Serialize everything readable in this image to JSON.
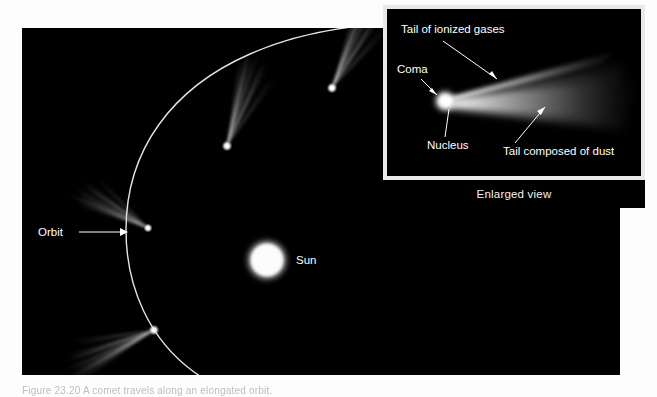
{
  "figure": {
    "background_color": "#ffffff",
    "panel_color": "#000000",
    "label_color": "#ffffff",
    "inset_border_color": "#e9e9e9"
  },
  "main_panel": {
    "name": "comet-orbit-panel",
    "labels": {
      "orbit": "Orbit",
      "sun": "Sun"
    },
    "sun": {
      "cx": 245,
      "cy": 232,
      "radius": 19,
      "color": "#ffffff"
    },
    "comets": [
      {
        "id": "comet-upper-right",
        "x": 310,
        "y": 60,
        "tail_angle": -62
      },
      {
        "id": "comet-upper-left",
        "x": 205,
        "y": 118,
        "tail_angle": -70
      },
      {
        "id": "comet-perihelion",
        "x": 126,
        "y": 200,
        "tail_angle": -118
      },
      {
        "id": "comet-lower-left",
        "x": 132,
        "y": 302,
        "tail_angle": 157
      },
      {
        "id": "comet-lower",
        "x": 196,
        "y": 357,
        "tail_angle": 128
      }
    ]
  },
  "inset": {
    "name": "enlarged-view-inset",
    "caption": "Enlarged view",
    "labels": {
      "ion_tail": "Tail of ionized gases",
      "coma": "Coma",
      "nucleus": "Nucleus",
      "dust_tail": "Tail composed of dust"
    },
    "nucleus": {
      "cx": 58,
      "cy": 92,
      "radius": 6,
      "color": "#ffffff"
    }
  },
  "bottom_caption": {
    "text": "Figure 23.20  A comet travels along an elongated orbit.",
    "visible": "partially cropped at page edge"
  }
}
